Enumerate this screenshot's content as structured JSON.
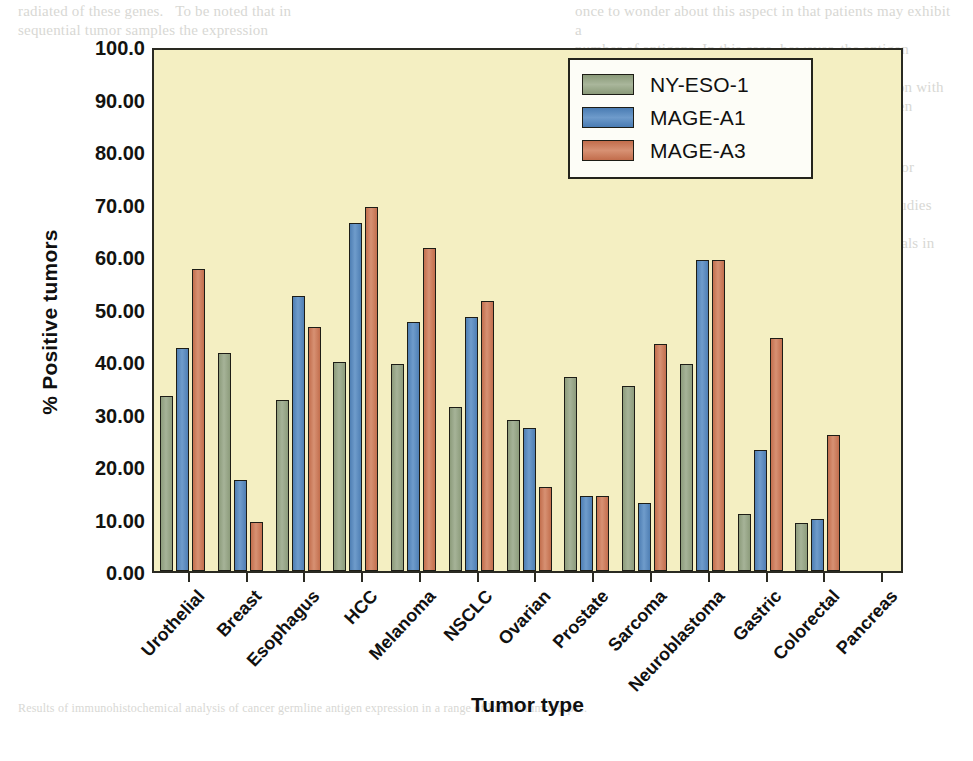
{
  "chart_data": {
    "type": "bar",
    "title": "",
    "xlabel": "Tumor type",
    "ylabel": "% Positive tumors",
    "ylim": [
      0,
      100
    ],
    "ytick_labels": [
      "100.0",
      "90.00",
      "80.00",
      "70.00",
      "60.00",
      "50.00",
      "40.00",
      "30.00",
      "20.00",
      "10.00",
      "0.00"
    ],
    "ytick_values": [
      100,
      90,
      80,
      70,
      60,
      50,
      40,
      30,
      20,
      10,
      0
    ],
    "grid": false,
    "legend_position": "top-right",
    "categories": [
      "Urothelial",
      "Breast",
      "Esophagus",
      "HCC",
      "Melanoma",
      "NSCLC",
      "Ovarian",
      "Prostate",
      "Sarcoma",
      "Neuroblastoma",
      "Gastric",
      "Colorectal",
      "Pancreas"
    ],
    "series": [
      {
        "name": "NY-ESO-1",
        "color": "#93a383",
        "values": [
          33.4,
          41.5,
          32.5,
          39.9,
          39.4,
          31.2,
          28.8,
          36.9,
          35.3,
          39.4,
          10.8,
          9.1,
          0.0
        ]
      },
      {
        "name": "MAGE-A1",
        "color": "#5a8cc0",
        "values": [
          42.5,
          17.3,
          52.4,
          66.2,
          47.4,
          48.3,
          27.3,
          14.3,
          12.9,
          59.2,
          23.0,
          9.9,
          0.0
        ]
      },
      {
        "name": "MAGE-A3",
        "color": "#cd7b5c",
        "values": [
          57.5,
          9.4,
          46.4,
          69.4,
          61.6,
          51.5,
          16.0,
          14.3,
          43.2,
          59.2,
          44.4,
          26.0,
          0.0
        ]
      }
    ],
    "plot_background": "#f4efc2",
    "axis_color": "#2a2a22"
  },
  "legend": {
    "entries": [
      {
        "label": "NY-ESO-1"
      },
      {
        "label": "MAGE-A1"
      },
      {
        "label": "MAGE-A3"
      }
    ]
  },
  "page_ghost": {
    "top_left": "radiated of these genes.   To be noted that in sequential tumor samples the expression",
    "top_right": "once to wonder about this aspect in that patients may exhibit a\nnumber of antigens. In this case, however, the antigen expression\ntumor cell lines. The association of antigen expression with\nresults in relapse and in overall survival have not been",
    "right": "Cancer Germline Antigen Expression\n\nmight be related to tumor cell type, cell lineage, or differen-\ntiation stage of the tumor cell of origin. These studies also\nprovide a basis for considering future vaccine trials in tumor\ntypes in which antigen expression is frequent.",
    "bottom": "Results of immunohistochemical analysis of cancer germline antigen expression in a range of human tumor types."
  }
}
